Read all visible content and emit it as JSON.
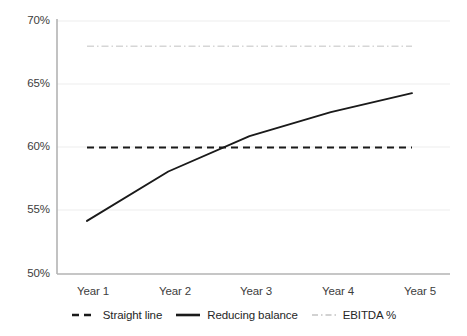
{
  "chart_data": {
    "type": "line",
    "title": "",
    "xlabel": "",
    "ylabel": "",
    "categories": [
      "Year 1",
      "Year 2",
      "Year 3",
      "Year 4",
      "Year 5"
    ],
    "x_tick_labels": [
      "Year 1",
      "Year 2",
      "Year 3",
      "Year 4",
      "Year 5"
    ],
    "y_tick_labels": [
      "50%",
      "55%",
      "60%",
      "65%",
      "70%"
    ],
    "ylim": [
      50,
      70
    ],
    "y_tick_values": [
      50,
      55,
      60,
      65,
      70
    ],
    "grid": "horizontal",
    "legend_position": "bottom-center",
    "series": [
      {
        "name": "Straight line",
        "style": "dashed",
        "color": "#1a1a1a",
        "values": [
          60.0,
          60.0,
          60.0,
          60.0,
          60.0
        ]
      },
      {
        "name": "Reducing balance",
        "style": "solid",
        "color": "#1a1a1a",
        "values": [
          54.2,
          58.1,
          60.9,
          62.8,
          64.3
        ]
      },
      {
        "name": "EBITDA %",
        "style": "dash-dot",
        "color": "#d6d6d6",
        "values": [
          68.0,
          68.0,
          68.0,
          68.0,
          68.0
        ]
      }
    ]
  },
  "axis": {
    "y_ticks": [
      {
        "label": "70%",
        "value": 70
      },
      {
        "label": "65%",
        "value": 65
      },
      {
        "label": "60%",
        "value": 60
      },
      {
        "label": "55%",
        "value": 55
      },
      {
        "label": "50%",
        "value": 50
      }
    ],
    "x_ticks": [
      {
        "label": "Year 1"
      },
      {
        "label": "Year 2"
      },
      {
        "label": "Year 3"
      },
      {
        "label": "Year 4"
      },
      {
        "label": "Year 5"
      }
    ]
  },
  "legend": {
    "items": [
      {
        "label": "Straight line",
        "style": "dashed",
        "color": "#1a1a1a"
      },
      {
        "label": "Reducing balance",
        "style": "solid",
        "color": "#1a1a1a"
      },
      {
        "label": "EBITDA %",
        "style": "dash-dot",
        "color": "#d6d6d6"
      }
    ]
  },
  "colors": {
    "grid": "#eeeeee",
    "axis": "#b0b0b0",
    "ink": "#1a1a1a",
    "ebitda": "#d6d6d6",
    "background": "#ffffff"
  }
}
